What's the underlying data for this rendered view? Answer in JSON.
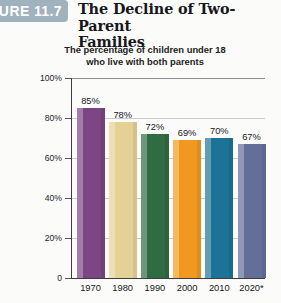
{
  "figure": {
    "badge_label": "GURE 11.7"
  },
  "header": {
    "title_line1": "The Decline of Two-Parent",
    "title_line2": "Families",
    "subtitle_line1": "The percentage of children under 18",
    "subtitle_line2": "who live with both parents"
  },
  "chart_data": {
    "type": "bar",
    "title": "The Decline of Two-Parent Families",
    "subtitle": "The percentage of children under 18 who live with both parents",
    "xlabel": "",
    "ylabel": "",
    "categories": [
      "1970",
      "1980",
      "1990",
      "2000",
      "2010",
      "2020*"
    ],
    "values": [
      85,
      78,
      72,
      69,
      70,
      67
    ],
    "value_labels": [
      "85%",
      "78%",
      "72%",
      "69%",
      "70%",
      "67%"
    ],
    "ylim": [
      0,
      100
    ],
    "ytick_values": [
      0,
      20,
      40,
      60,
      80,
      100
    ],
    "ytick_labels": [
      "0",
      "20%",
      "40%",
      "60%",
      "80%",
      "100%"
    ],
    "grid": true,
    "legend": "none",
    "bar_colors": [
      "#7c4584",
      "#e5d096",
      "#2f6b43",
      "#f0981f",
      "#1d7395",
      "#636e99"
    ],
    "footnote_marker": "*"
  }
}
